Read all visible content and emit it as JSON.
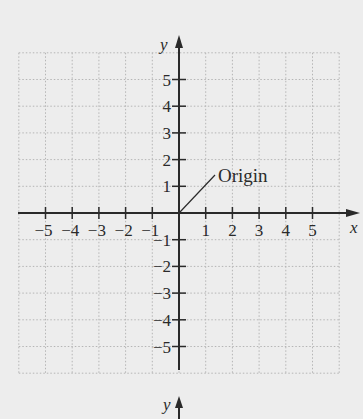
{
  "diagram": {
    "type": "coordinate-plane",
    "x_axis": {
      "name": "x",
      "ticks": [
        -5,
        -4,
        -3,
        -2,
        -1,
        1,
        2,
        3,
        4,
        5
      ],
      "tick_labels": [
        "−5",
        "−4",
        "−3",
        "−2",
        "−1",
        "1",
        "2",
        "3",
        "4",
        "5"
      ]
    },
    "y_axis": {
      "name": "y",
      "ticks": [
        5,
        4,
        3,
        2,
        1,
        -1,
        -2,
        -3,
        -4,
        -5
      ],
      "tick_labels": [
        "5",
        "4",
        "3",
        "2",
        "1",
        "−1",
        "−2",
        "−3",
        "−4",
        "−5"
      ]
    },
    "grid": {
      "range": [
        -6,
        6
      ],
      "style": "dotted"
    },
    "annotation": {
      "text": "Origin",
      "points_to": [
        0,
        0
      ]
    },
    "second_plane": {
      "y_axis_name": "y"
    },
    "colors": {
      "background": "#ededed",
      "axis": "#2a2a2a",
      "grid": "#b5b5b5"
    }
  }
}
